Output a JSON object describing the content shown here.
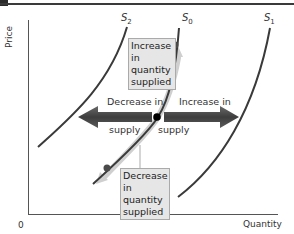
{
  "diagram": {
    "type": "supply-shift-diagram",
    "axes": {
      "y_label": "Price",
      "x_label": "Quantity",
      "origin_label": "0"
    },
    "curves": [
      {
        "name": "S",
        "subscript": "2",
        "role": "decreased supply"
      },
      {
        "name": "S",
        "subscript": "0",
        "role": "original supply"
      },
      {
        "name": "S",
        "subscript": "1",
        "role": "increased supply"
      }
    ],
    "annotations": {
      "increase_quantity_supplied": [
        "Increase in",
        "quantity",
        "supplied"
      ],
      "decrease_quantity_supplied": [
        "Decrease in",
        "quantity",
        "supplied"
      ],
      "decrease_supply": {
        "top": "Decrease in",
        "bottom": "supply"
      },
      "increase_supply": {
        "top": "Increase in",
        "bottom": "supply"
      }
    },
    "colors": {
      "curve": "#3a3a3a",
      "arrow": "#4a4a4a",
      "movement_arrow": "#c8c8c8",
      "label_box": "#e6e6e6",
      "point_upper": "#4a4a4a",
      "point_center": "#000000"
    }
  }
}
